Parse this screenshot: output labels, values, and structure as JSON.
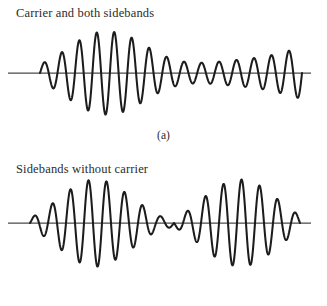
{
  "figure": {
    "background_color": "#ffffff",
    "trace_color": "#1c1c1c",
    "axis_color": "#4a4a4a",
    "width": 327,
    "height": 306
  },
  "panels": [
    {
      "id": "a",
      "caption": "Carrier and both sidebands",
      "label": "(a)"
    },
    {
      "id": "b",
      "caption": "Sidebands without carrier",
      "label": "(b)"
    }
  ],
  "chart_data": [
    {
      "type": "line",
      "title": "Carrier and both sidebands",
      "label": "(a)",
      "xlabel": "",
      "ylabel": "",
      "grid": false,
      "legend": null,
      "axis": {
        "baseline_y": 73,
        "x_start": 8,
        "x_end": 311
      },
      "description": "Amplitude-modulated carrier: envelope A(t) = 1 + m*cos(wm*t) with full carrier present, so the waveform never nulls to zero; amplitude is maximum on the left and decays toward a steady small carrier level on the right before a final rise.",
      "model": {
        "carrier_cycles": 15,
        "modulation_index": 0.85,
        "envelope_type": "carrier-plus-sidebands",
        "peak_amplitude": 42,
        "residual_amplitude": 9
      },
      "x": [
        0,
        0.0667,
        0.1333,
        0.2,
        0.2667,
        0.3333,
        0.4,
        0.4667,
        0.5333,
        0.6,
        0.6667,
        0.7333,
        0.8,
        0.8667,
        0.9333,
        1.0
      ],
      "envelope": [
        0.2,
        0.42,
        0.72,
        0.95,
        1.0,
        0.9,
        0.66,
        0.42,
        0.28,
        0.24,
        0.26,
        0.3,
        0.34,
        0.4,
        0.5,
        0.62
      ],
      "peak_values": [
        8,
        17,
        29,
        38,
        40,
        36,
        26,
        17,
        11,
        10,
        10,
        12,
        14,
        16,
        20,
        25
      ]
    },
    {
      "type": "line",
      "title": "Sidebands without carrier",
      "label": "(b)",
      "xlabel": "",
      "ylabel": "",
      "grid": false,
      "legend": null,
      "axis": {
        "baseline_y": 223,
        "x_start": 8,
        "x_end": 311
      },
      "description": "Double-sideband suppressed-carrier signal: envelope |cos(wm*t)| so the waveform collapses to zero at the centre null and the carrier phase reverses; two symmetric beats of equal peak amplitude appear either side of the null, with a small residual beat at the right end.",
      "model": {
        "carrier_cycles": 15,
        "modulation_index": 1.0,
        "envelope_type": "suppressed-carrier",
        "peak_amplitude": 44,
        "null_amplitude": 0
      },
      "x": [
        0,
        0.0667,
        0.1333,
        0.2,
        0.2667,
        0.3333,
        0.4,
        0.4667,
        0.5333,
        0.6,
        0.6667,
        0.7333,
        0.8,
        0.8667,
        0.9333,
        1.0
      ],
      "envelope": [
        0.1,
        0.36,
        0.7,
        0.96,
        1.0,
        0.78,
        0.48,
        0.18,
        0.08,
        0.34,
        0.7,
        0.95,
        1.0,
        0.8,
        0.46,
        0.16
      ],
      "peak_values": [
        4,
        15,
        30,
        41,
        43,
        33,
        20,
        8,
        3,
        14,
        30,
        41,
        43,
        34,
        19,
        7
      ]
    }
  ]
}
